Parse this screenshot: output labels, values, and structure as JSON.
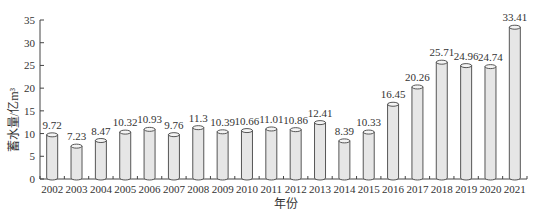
{
  "chart_data": {
    "type": "bar",
    "title": "",
    "xlabel": "年份",
    "ylabel": "蓄水量/亿m³",
    "ylim": [
      0,
      35
    ],
    "yticks": [
      0,
      5,
      10,
      15,
      20,
      25,
      30,
      35
    ],
    "grid": false,
    "legend": null,
    "bar_style": "cylinder",
    "bar_color": "#e6e6e6",
    "categories": [
      "2002",
      "2003",
      "2004",
      "2005",
      "2006",
      "2007",
      "2008",
      "2009",
      "2010",
      "2011",
      "2012",
      "2013",
      "2014",
      "2015",
      "2016",
      "2017",
      "2018",
      "2019",
      "2020",
      "2021"
    ],
    "values": [
      9.72,
      7.23,
      8.47,
      10.32,
      10.93,
      9.76,
      11.3,
      10.39,
      10.66,
      11.01,
      10.86,
      12.41,
      8.39,
      10.33,
      16.45,
      20.26,
      25.71,
      24.96,
      24.74,
      33.41
    ],
    "value_labels": [
      "9.72",
      "7.23",
      "8.47",
      "10.32",
      "10.93",
      "9.76",
      "11.3",
      "10.39",
      "10.66",
      "11.01",
      "10.86",
      "12.41",
      "8.39",
      "10.33",
      "16.45",
      "20.26",
      "25.71",
      "24.96",
      "24.74",
      "33.41"
    ]
  }
}
